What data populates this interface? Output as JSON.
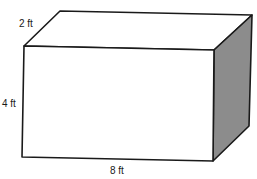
{
  "figure": {
    "type": "rectangular-prism",
    "labels": {
      "depth": "2 ft",
      "height": "4 ft",
      "length": "8 ft"
    },
    "colors": {
      "edge": "#1a1a1a",
      "front_face": "#ffffff",
      "top_face": "#ffffff",
      "side_face": "#8c8c8c"
    }
  }
}
